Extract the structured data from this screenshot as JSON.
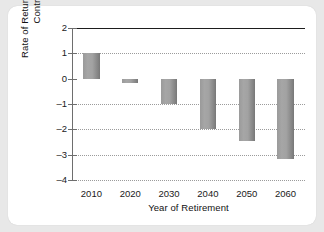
{
  "chart_data": {
    "type": "bar",
    "title": "",
    "xlabel": "Year of Retirement",
    "ylabel": "Rate of Return on Social Security Contributions (%)",
    "categories": [
      "2010",
      "2020",
      "2030",
      "2040",
      "2050",
      "2060"
    ],
    "values": [
      1.0,
      -0.17,
      -1.0,
      -2.0,
      -2.48,
      -3.18
    ],
    "ylim": [
      -4,
      2
    ],
    "yticks": [
      "2",
      "1",
      "0",
      "–1",
      "–2",
      "–3",
      "–4"
    ],
    "ytick_values": [
      2,
      1,
      0,
      -1,
      -2,
      -3,
      -4
    ],
    "grid": "horizontal-dotted",
    "legend": "none",
    "bar_color": "#a2a2a2",
    "zero_line_color": "#1d1d1d",
    "axis_color": "#6e6e6e",
    "gridline_color": "#9b9b9b",
    "panel_background": "#ffffff",
    "page_background": "#e8e8e8"
  }
}
